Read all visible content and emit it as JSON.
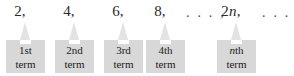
{
  "figure": {
    "type": "sequence-diagram",
    "box_fill": "#d8d8d8",
    "pointer_fill": "#e3e3e3",
    "background": "#ffffff",
    "text_color": "#1c1c1c"
  },
  "sequence": {
    "values": [
      {
        "text": "2,",
        "x": 16
      },
      {
        "text": "4,",
        "x": 66
      },
      {
        "text": "6,",
        "x": 117
      },
      {
        "text": "8,",
        "x": 156
      },
      {
        "text": "2n,",
        "x": 218
      }
    ],
    "value_plain": [
      "2,",
      "4,",
      "6,",
      "8,",
      "2n,"
    ],
    "variable_term": {
      "coefficient": "2",
      "variable": "n",
      "comma": ","
    },
    "ellipses": [
      {
        "text": ". . . ,",
        "x": 186
      },
      {
        "text": ". . .",
        "x": 262
      }
    ],
    "ellipsis_mid": ". . . ,",
    "ellipsis_end": ". . ."
  },
  "terms": [
    {
      "ordinal": "1st",
      "word": "term",
      "x": 6,
      "italic_prefix": ""
    },
    {
      "ordinal": "2nd",
      "word": "term",
      "x": 55,
      "italic_prefix": ""
    },
    {
      "ordinal": "3rd",
      "word": "term",
      "x": 104,
      "italic_prefix": ""
    },
    {
      "ordinal": "4th",
      "word": "term",
      "x": 146,
      "italic_prefix": ""
    },
    {
      "ordinal": "th",
      "word": "term",
      "x": 217,
      "italic_prefix": "n"
    }
  ],
  "labels": {
    "term_1_ordinal": "1st",
    "term_2_ordinal": "2nd",
    "term_3_ordinal": "3rd",
    "term_4_ordinal": "4th",
    "term_n_ordinal_italic": "n",
    "term_n_ordinal_rest": "th",
    "term_word": "term"
  }
}
